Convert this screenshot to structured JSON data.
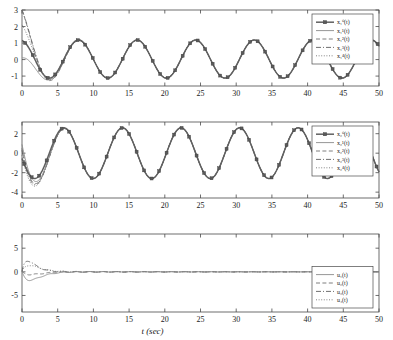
{
  "figure": {
    "xlabel": "t (sec)",
    "panels": [
      {
        "id": "panel-x1",
        "ylim": [
          -1.6,
          3.0
        ],
        "yticks": [
          -1,
          0,
          1,
          2,
          3
        ],
        "yticklabels": [
          "-1",
          "0",
          "1",
          "2",
          "3"
        ],
        "legend": [
          {
            "label": "x₁⁰(t)",
            "style": "solid-marker"
          },
          {
            "label": "x₁¹(t)",
            "style": "solid"
          },
          {
            "label": "x₁²(t)",
            "style": "dashed"
          },
          {
            "label": "x₁³(t)",
            "style": "dashdot"
          },
          {
            "label": "x₁⁴(t)",
            "style": "dotted"
          }
        ]
      },
      {
        "id": "panel-x2",
        "ylim": [
          -4.6,
          3.2
        ],
        "yticks": [
          -4,
          -2,
          0,
          2
        ],
        "yticklabels": [
          "-4",
          "-2",
          "0",
          "2"
        ],
        "legend": [
          {
            "label": "x₂⁰(t)",
            "style": "solid-marker"
          },
          {
            "label": "x₂¹(t)",
            "style": "solid"
          },
          {
            "label": "x₂²(t)",
            "style": "dashed"
          },
          {
            "label": "x₂³(t)",
            "style": "dashdot"
          },
          {
            "label": "x₂⁴(t)",
            "style": "dotted"
          }
        ]
      },
      {
        "id": "panel-u",
        "ylim": [
          -8.5,
          8.0
        ],
        "yticks": [
          -5,
          0,
          5
        ],
        "yticklabels": [
          "-5",
          "0",
          "5"
        ],
        "legend": [
          {
            "label": "u₁(t)",
            "style": "solid"
          },
          {
            "label": "u₂(t)",
            "style": "dashed"
          },
          {
            "label": "u₃(t)",
            "style": "dashdot"
          },
          {
            "label": "u₄(t)",
            "style": "dotted"
          }
        ]
      }
    ],
    "xticks": [
      0,
      5,
      10,
      15,
      20,
      25,
      30,
      35,
      40,
      45,
      50
    ],
    "xticklabels": [
      "0",
      "5",
      "10",
      "15",
      "20",
      "25",
      "30",
      "35",
      "40",
      "45",
      "50"
    ],
    "xlim": [
      0,
      50
    ]
  },
  "chart_data": {
    "type": "line",
    "title": "",
    "xlabel": "t (sec)",
    "ylabel": "",
    "subplots": [
      {
        "name": "state-x1",
        "ylabel": "",
        "xlim": [
          0,
          50
        ],
        "ylim": [
          -1.6,
          3.0
        ],
        "xticks": [
          0,
          5,
          10,
          15,
          20,
          25,
          30,
          35,
          40,
          45,
          50
        ],
        "yticks": [
          -1,
          0,
          1,
          2,
          3
        ],
        "grid": false,
        "legend_position": "upper-right",
        "series": [
          {
            "name": "x₁⁰(t)",
            "style": "solid-marker",
            "description": "leader state, steady sinusoid amplitude 1.15, period 8.2 s, phase such that peak near t=0.4",
            "model": {
              "type": "sinusoid",
              "amplitude": 1.15,
              "period": 8.2,
              "phase_deg": 12,
              "offset": 0.03,
              "decay": 0
            },
            "x": [
              0,
              1,
              2,
              3,
              4,
              5,
              6,
              7,
              8,
              9,
              10,
              12,
              14,
              16,
              18,
              20,
              24,
              28,
              32,
              36,
              40,
              44,
              48,
              50
            ],
            "y": [
              1.12,
              0.85,
              0.28,
              -0.45,
              -0.95,
              -1.13,
              -0.88,
              -0.32,
              0.42,
              0.96,
              1.14,
              0.36,
              -0.92,
              1.02,
              0.46,
              -0.86,
              1.11,
              -1.07,
              1.18,
              -1.09,
              1.14,
              -1.05,
              0.62,
              1.12
            ]
          },
          {
            "name": "x₁¹(t)",
            "style": "solid",
            "description": "follower 1, starts near 0.1, dips to -1.55 near t=5, converges to leader by t≈10",
            "model": {
              "type": "sinusoid-transient",
              "init": 0.1,
              "undershoot": -1.55,
              "settle_t": 10
            }
          },
          {
            "name": "x₁²(t)",
            "style": "dashed",
            "description": "follower 2, starts at 3.0 (clipped at top), drops to -1.2 near t=4.8, converges by t≈8",
            "model": {
              "type": "sinusoid-transient",
              "init": 3.0,
              "undershoot": -1.2,
              "settle_t": 8
            }
          },
          {
            "name": "x₁³(t)",
            "style": "dashdot",
            "description": "follower 3, starts at 3.0, crosses down to -0.95 near t=4.6, converges by t≈8",
            "model": {
              "type": "sinusoid-transient",
              "init": 3.0,
              "undershoot": -0.95,
              "settle_t": 8
            }
          },
          {
            "name": "x₁⁴(t)",
            "style": "dotted",
            "description": "follower 4, starts at 2.1, declines to -1.25 near t=5, converges by t≈9",
            "model": {
              "type": "sinusoid-transient",
              "init": 2.1,
              "undershoot": -1.25,
              "settle_t": 9
            }
          }
        ]
      },
      {
        "name": "state-x2",
        "ylabel": "",
        "xlim": [
          0,
          50
        ],
        "ylim": [
          -4.6,
          3.2
        ],
        "xticks": [
          0,
          5,
          10,
          15,
          20,
          25,
          30,
          35,
          40,
          45,
          50
        ],
        "yticks": [
          -4,
          -2,
          0,
          2
        ],
        "grid": false,
        "legend_position": "upper-right",
        "series": [
          {
            "name": "x₂⁰(t)",
            "style": "solid-marker",
            "description": "leader velocity state, sinusoid amplitude 2.6, period 8.2 s, leads x1 by 90 degrees",
            "model": {
              "type": "sinusoid",
              "amplitude": 2.6,
              "period": 8.2,
              "phase_deg": 102,
              "offset": 0.0,
              "decay": 0
            },
            "x": [
              0,
              1,
              2,
              3,
              4,
              5,
              6,
              7,
              8,
              10,
              14,
              18,
              22,
              26,
              30,
              34,
              38,
              42,
              46,
              50
            ],
            "y": [
              0.0,
              -1.45,
              -2.35,
              -2.55,
              -1.85,
              -0.6,
              1.0,
              2.15,
              2.6,
              0.45,
              -2.55,
              2.1,
              2.5,
              -1.95,
              -2.2,
              2.45,
              1.1,
              -2.55,
              1.45,
              0.0
            ]
          },
          {
            "name": "x₂¹(t)",
            "style": "solid",
            "description": "follower 1 velocity, starts ~0.9, dips to -3.4 near t=2.6, converges by t≈7"
          },
          {
            "name": "x₂²(t)",
            "style": "dashed",
            "description": "follower 2 velocity, starts ~0.5, dips to -4.0 near t=2.7, converges by t≈7"
          },
          {
            "name": "x₂³(t)",
            "style": "dashdot",
            "description": "follower 3 velocity, starts ~0.3, dips to -4.3 near t=2.8, converges by t≈7"
          },
          {
            "name": "x₂⁴(t)",
            "style": "dotted",
            "description": "follower 4 velocity, starts ~-0.2, dips to -4.45 near t=2.9, converges by t≈7"
          }
        ]
      },
      {
        "name": "control-u",
        "ylabel": "",
        "xlim": [
          0,
          50
        ],
        "ylim": [
          -8.5,
          8.0
        ],
        "xticks": [
          0,
          5,
          10,
          15,
          20,
          25,
          30,
          35,
          40,
          45,
          50
        ],
        "yticks": [
          -5,
          0,
          5
        ],
        "grid": false,
        "legend_position": "lower-right",
        "series": [
          {
            "name": "u₁(t)",
            "style": "solid",
            "description": "control input 1, dips to about -2.1 near t=1.3 then decays to 0 by t≈14",
            "model": {
              "type": "decaying",
              "peak": -2.1,
              "peak_t": 1.3,
              "settle_t": 14
            }
          },
          {
            "name": "u₂(t)",
            "style": "dashed",
            "description": "control input 2, small negative dip near -0.7 at t=1.5 then settles to 0",
            "model": {
              "type": "decaying",
              "peak": -0.7,
              "peak_t": 1.5,
              "settle_t": 13
            }
          },
          {
            "name": "u₃(t)",
            "style": "dashdot",
            "description": "control input 3, rises to about 2.6 near t=0.9 then decays to 0 by t≈14",
            "model": {
              "type": "decaying",
              "peak": 2.6,
              "peak_t": 0.9,
              "settle_t": 14
            }
          },
          {
            "name": "u₄(t)",
            "style": "dotted",
            "description": "control input 4, rises to about 1.6 near t=1.2 then decays to 0 by t≈14",
            "model": {
              "type": "decaying",
              "peak": 1.6,
              "peak_t": 1.2,
              "settle_t": 14
            }
          }
        ]
      }
    ]
  }
}
